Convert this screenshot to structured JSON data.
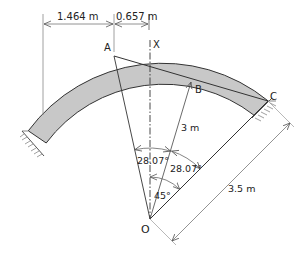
{
  "diagram": {
    "type": "circular arch rib with supports",
    "points": {
      "A": "A",
      "B": "B",
      "C": "C",
      "X": "X",
      "O": "O"
    },
    "dimensions": {
      "horizontal_left": "1.464 m",
      "horizontal_right": "0.657 m",
      "radius_to_B": "3 m",
      "radius_outer": "3.5 m"
    },
    "angles": {
      "angle_AOB": "28.07°",
      "angle_BOC": "28.07°",
      "angle_XOC": "45°"
    },
    "colors": {
      "arch_fill": "#c8c8c8",
      "line": "#333333",
      "dim_line": "#777777"
    }
  }
}
